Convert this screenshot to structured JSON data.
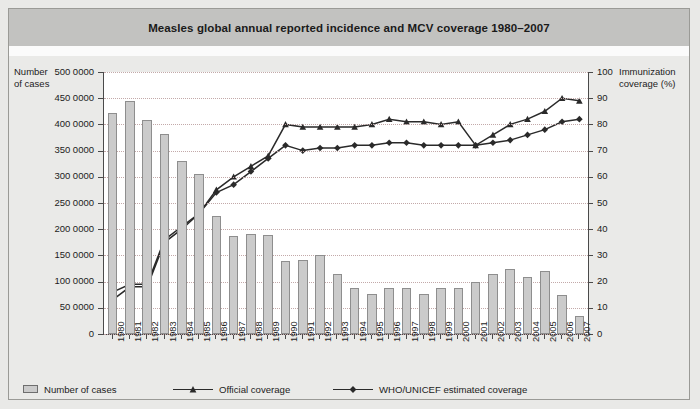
{
  "title": "Measles global annual reported incidence and MCV coverage 1980–2007",
  "axes": {
    "y_left_title_line1": "Number",
    "y_left_title_line2": "of cases",
    "y_right_title_line1": "Immunization",
    "y_right_title_line2": "coverage (%)",
    "y_left_ticks": [
      "0",
      "50 0000",
      "100 0000",
      "150 0000",
      "200 0000",
      "250 0000",
      "300 0000",
      "350 0000",
      "400 0000",
      "450 0000",
      "500 0000"
    ],
    "y_right_ticks": [
      "0",
      "10",
      "20",
      "30",
      "40",
      "50",
      "60",
      "70",
      "80",
      "90",
      "100"
    ]
  },
  "legend": {
    "items": [
      {
        "label": "Number of cases",
        "marker": "bar-swatch",
        "color": "#cbcbcb"
      },
      {
        "label": "Official coverage",
        "marker": "triangle-marker",
        "color": "#2a2a2a"
      },
      {
        "label": "WHO/UNICEF estimated coverage",
        "marker": "diamond-marker",
        "color": "#2a2a2a"
      }
    ]
  },
  "chart_data": {
    "type": "bar",
    "title": "Measles global annual reported incidence and MCV coverage 1980–2007",
    "xlabel": "",
    "ylabel": "Number of cases",
    "y2label": "Immunization coverage (%)",
    "ylim": [
      0,
      5000000
    ],
    "y2lim": [
      0,
      100
    ],
    "ytick_step": 500000,
    "y2tick_step": 10,
    "grid": true,
    "legend_position": "bottom",
    "categories": [
      "1980",
      "1981",
      "1982",
      "1983",
      "1984",
      "1985",
      "1986",
      "1987",
      "1988",
      "1989",
      "1990",
      "1991",
      "1992",
      "1993",
      "1994",
      "1995",
      "1996",
      "1997",
      "1998",
      "1999",
      "2000",
      "2001",
      "2002",
      "2003",
      "2004",
      "2005",
      "2006",
      "2007"
    ],
    "series": [
      {
        "name": "Number of cases",
        "type": "bar",
        "axis": "left",
        "color": "#cbcbcb",
        "values": [
          4210000,
          4450000,
          4090000,
          3820000,
          3300000,
          3050000,
          2250000,
          1880000,
          1900000,
          1890000,
          1400000,
          1420000,
          1500000,
          1150000,
          880000,
          770000,
          880000,
          870000,
          760000,
          870000,
          880000,
          1000000,
          1150000,
          1250000,
          1090000,
          1200000,
          750000,
          350000
        ]
      },
      {
        "name": "Official coverage",
        "type": "line",
        "axis": "right",
        "marker": "triangle",
        "color": "#2a2a2a",
        "values": [
          13,
          18,
          18,
          35,
          40,
          46,
          55,
          60,
          64,
          68,
          80,
          79,
          79,
          79,
          79,
          80,
          82,
          81,
          81,
          80,
          81,
          72,
          76,
          80,
          82,
          85,
          90,
          89
        ]
      },
      {
        "name": "WHO/UNICEF estimated coverage",
        "type": "line",
        "axis": "right",
        "marker": "diamond",
        "color": "#2a2a2a",
        "values": [
          16,
          19,
          19,
          36,
          41,
          46,
          54,
          57,
          62,
          67,
          72,
          70,
          71,
          71,
          72,
          72,
          73,
          73,
          72,
          72,
          72,
          72,
          73,
          74,
          76,
          78,
          81,
          82
        ]
      }
    ]
  }
}
